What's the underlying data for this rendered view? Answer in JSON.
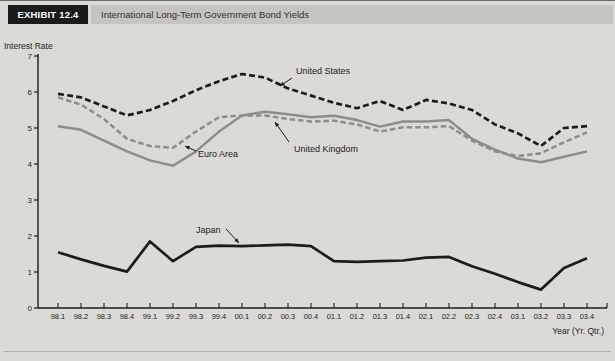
{
  "header": {
    "exhibit_label": "EXHIBIT 12.4",
    "title": "International Long-Term Government Bond Yields"
  },
  "axes": {
    "y_title": "Interest Rate",
    "x_title": "Year (Yr. Qtr.)"
  },
  "colors": {
    "background": "#dbdad6",
    "header_box": "#1b1b1b",
    "header_bar": "#c6c5c0",
    "black_line": "#1c1c1c",
    "gray_line": "#8e8d8a",
    "axis": "#1c1c1c"
  },
  "chart_data": {
    "type": "line",
    "title": "International Long-Term Government Bond Yields",
    "xlabel": "Year (Yr. Qtr.)",
    "ylabel": "Interest Rate",
    "ylim": [
      0,
      7
    ],
    "y_ticks": [
      0,
      1,
      2,
      3,
      4,
      5,
      6,
      7
    ],
    "grid": false,
    "legend_position": "inline-annotations",
    "categories": [
      "98.1",
      "98.2",
      "98.3",
      "98.4",
      "99.1",
      "99.2",
      "99.3",
      "99.4",
      "00.1",
      "00.2",
      "00.3",
      "00.4",
      "01.1",
      "01.2",
      "01.3",
      "01.4",
      "02.1",
      "02.2",
      "02.3",
      "02.4",
      "03.1",
      "03.2",
      "03.3",
      "03.4"
    ],
    "series": [
      {
        "name": "United Kingdom",
        "color": "#8e8d8a",
        "style": "dashed",
        "values": [
          5.85,
          5.65,
          5.25,
          4.7,
          4.5,
          4.45,
          4.9,
          5.3,
          5.35,
          5.35,
          5.25,
          5.18,
          5.2,
          5.1,
          4.9,
          5.02,
          5.02,
          5.05,
          4.65,
          4.35,
          4.22,
          4.3,
          4.6,
          4.88
        ]
      },
      {
        "name": "Euro Area",
        "color": "#8e8d8a",
        "style": "solid",
        "values": [
          5.05,
          4.95,
          4.65,
          4.35,
          4.1,
          3.95,
          4.35,
          4.9,
          5.35,
          5.45,
          5.38,
          5.3,
          5.34,
          5.22,
          5.04,
          5.18,
          5.18,
          5.22,
          4.7,
          4.4,
          4.15,
          4.05,
          4.2,
          4.35
        ]
      },
      {
        "name": "United States",
        "color": "#1c1c1c",
        "style": "dashed",
        "values": [
          5.95,
          5.85,
          5.6,
          5.35,
          5.5,
          5.75,
          6.05,
          6.3,
          6.5,
          6.4,
          6.1,
          5.9,
          5.7,
          5.55,
          5.75,
          5.5,
          5.78,
          5.68,
          5.5,
          5.1,
          4.85,
          4.5,
          5.0,
          5.05
        ]
      },
      {
        "name": "Japan",
        "color": "#1c1c1c",
        "style": "solid",
        "values": [
          1.55,
          1.35,
          1.17,
          1.01,
          1.85,
          1.3,
          1.7,
          1.73,
          1.72,
          1.74,
          1.76,
          1.72,
          1.3,
          1.28,
          1.3,
          1.32,
          1.4,
          1.42,
          1.16,
          0.95,
          0.72,
          0.51,
          1.11,
          1.38
        ]
      }
    ],
    "annotations": [
      {
        "label": "United States",
        "text_x": 296,
        "text_y": 73,
        "anchor": "start",
        "arrow": [
          292,
          77,
          280,
          85
        ]
      },
      {
        "label": "United Kingdom",
        "text_x": 294,
        "text_y": 151,
        "anchor": "start",
        "arrow": [
          289,
          141,
          275,
          121
        ]
      },
      {
        "label": "Euro Area",
        "text_x": 198,
        "text_y": 156,
        "anchor": "start",
        "arrow": [
          196,
          150,
          185,
          145
        ]
      },
      {
        "label": "Japan",
        "text_x": 196,
        "text_y": 232,
        "anchor": "start",
        "arrow": [
          226,
          228,
          239,
          242
        ]
      }
    ]
  }
}
